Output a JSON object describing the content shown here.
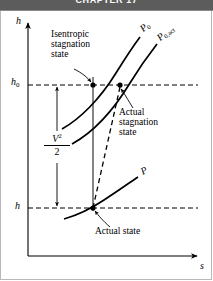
{
  "header": {
    "title": "CHAPTER 17",
    "bar_color": "#5c5c5c"
  },
  "figure": {
    "type": "h-s thermodynamic diagram",
    "axes": {
      "y_label": "h",
      "x_label": "s",
      "y_tick_upper": "h",
      "y_tick_upper_sub": "0",
      "y_tick_lower": "h"
    },
    "curves": [
      {
        "name": "isentropic-stagnation-pressure",
        "label": "P",
        "sublabel": "0"
      },
      {
        "name": "actual-stagnation-pressure",
        "label": "P",
        "sublabel": "0,act"
      },
      {
        "name": "static-pressure",
        "label": "P",
        "sublabel": ""
      }
    ],
    "annotations": [
      {
        "name": "isentropic-stagnation-state",
        "lines": [
          "Isentropic",
          "stagnation",
          "state"
        ]
      },
      {
        "name": "actual-stagnation-state",
        "lines": [
          "Actual",
          "stagnation",
          "state"
        ]
      },
      {
        "name": "actual-state",
        "lines": [
          "Actual state"
        ]
      }
    ],
    "kinetic_energy": {
      "numerator": "V",
      "exponent": "2",
      "denominator": "2"
    },
    "colors": {
      "ink": "#000000",
      "frame": "#b8b8b8",
      "header": "#5c5c5c"
    }
  }
}
